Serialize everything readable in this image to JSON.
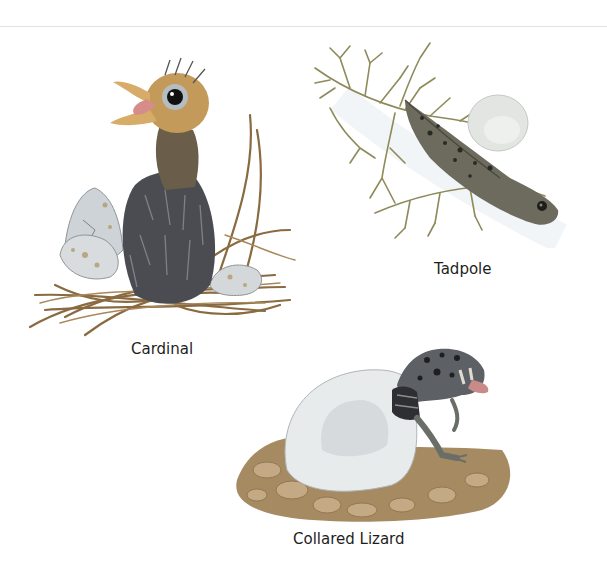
{
  "page": {
    "figures": [
      {
        "id": "cardinal",
        "caption": "Cardinal"
      },
      {
        "id": "tadpole",
        "caption": "Tadpole"
      },
      {
        "id": "lizard",
        "caption": "Collared Lizard"
      }
    ]
  },
  "colors": {
    "background": "#ffffff",
    "caption_text": "#1e1e1e",
    "rule": "#e2e2e2"
  }
}
